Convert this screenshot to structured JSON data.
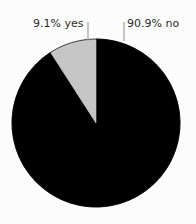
{
  "chart_data": {
    "type": "pie",
    "title": "",
    "labels": [
      "no",
      "yes"
    ],
    "values": [
      90.9,
      9.1
    ],
    "value_labels": [
      "90.9% no",
      "9.1% yes"
    ],
    "colors": [
      "#000000",
      "#c8c8c8"
    ],
    "legend": "none",
    "grid": false,
    "annotations": [
      {
        "text": "9.1% yes",
        "slice": "yes",
        "position": "upper-left"
      },
      {
        "text": "90.9% no",
        "slice": "no",
        "position": "upper-right"
      }
    ],
    "start_angle_deg": 90,
    "direction": "clockwise",
    "units": "percent"
  },
  "figure": {
    "background_color": "#ffffff",
    "label_text_color": "#2b2b2b",
    "leader_line_color": "#9a9a9a",
    "slice_yes_color": "#c8c8c8",
    "slice_no_color": "#000000",
    "labels": {
      "yes": "9.1% yes",
      "no": "90.9% no"
    }
  }
}
